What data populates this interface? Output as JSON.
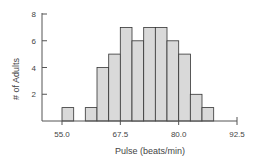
{
  "chart_data": {
    "type": "bar",
    "title": "",
    "xlabel": "Pulse (beats/min)",
    "ylabel": "# of Adults",
    "bin_width": 2.5,
    "bins": [
      {
        "start": 55.0,
        "end": 57.5,
        "count": 1
      },
      {
        "start": 57.5,
        "end": 60.0,
        "count": 0
      },
      {
        "start": 60.0,
        "end": 62.5,
        "count": 1
      },
      {
        "start": 62.5,
        "end": 65.0,
        "count": 4
      },
      {
        "start": 65.0,
        "end": 67.5,
        "count": 5
      },
      {
        "start": 67.5,
        "end": 70.0,
        "count": 7
      },
      {
        "start": 70.0,
        "end": 72.5,
        "count": 6
      },
      {
        "start": 72.5,
        "end": 75.0,
        "count": 7
      },
      {
        "start": 75.0,
        "end": 77.5,
        "count": 7
      },
      {
        "start": 77.5,
        "end": 80.0,
        "count": 6
      },
      {
        "start": 80.0,
        "end": 82.5,
        "count": 5
      },
      {
        "start": 82.5,
        "end": 85.0,
        "count": 2
      },
      {
        "start": 85.0,
        "end": 87.5,
        "count": 1
      }
    ],
    "x_ticks": [
      "55.0",
      "67.5",
      "80.0",
      "92.5"
    ],
    "x_tick_values": [
      55.0,
      67.5,
      80.0,
      92.5
    ],
    "y_ticks": [
      "2",
      "4",
      "6",
      "8"
    ],
    "y_tick_values": [
      2,
      4,
      6,
      8
    ],
    "xlim": [
      50.0,
      92.5
    ],
    "ylim": [
      0,
      8
    ],
    "grid": false,
    "legend": null,
    "colors": {
      "bar_fill": "#d9d9d9",
      "bar_stroke": "#333333",
      "axis": "#555555"
    }
  }
}
